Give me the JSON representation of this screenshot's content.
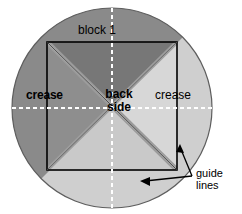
{
  "figure": {
    "type": "origami-fold-diagram",
    "labels": {
      "block_1": "block 1",
      "crease_left": "crease",
      "crease_right": "crease",
      "back_side_line1": "back",
      "back_side_line2": "side",
      "guide_lines_line1": "guide",
      "guide_lines_line2": "lines"
    },
    "colors": {
      "background": "#ffffff",
      "circle_dark": "#8a8a8a",
      "circle_light": "#cfcfcf",
      "triangle_top": "#777777",
      "triangle_left": "#8e8e8e",
      "triangle_right": "#d7d7d7",
      "triangle_bottom": "#c9c9c9",
      "crease_band": "#9b9b9b",
      "outline": "#000000",
      "guide_line": "#ffffff"
    },
    "geometry": {
      "circle_center_x": 112,
      "circle_center_y": 108,
      "circle_radius": 100,
      "square_left": 47,
      "square_top": 42,
      "square_right": 177,
      "square_bottom": 170
    }
  }
}
